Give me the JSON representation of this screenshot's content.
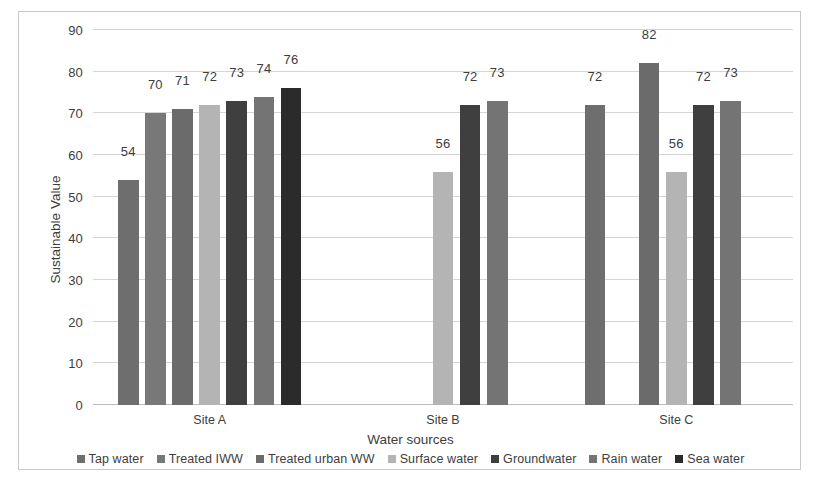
{
  "chart_data": {
    "type": "bar",
    "title": "",
    "xlabel": "Water sources",
    "ylabel": "Sustainable Value",
    "categories": [
      "Site A",
      "Site B",
      "Site C"
    ],
    "ylim": [
      0,
      90
    ],
    "yticks": [
      0,
      10,
      20,
      30,
      40,
      50,
      60,
      70,
      80,
      90
    ],
    "grid": true,
    "legend_position": "bottom",
    "series": [
      {
        "name": "Tap water",
        "color": "#6e6e6e",
        "values": [
          54,
          null,
          72
        ],
        "labels": [
          "54",
          "",
          "72"
        ]
      },
      {
        "name": "Treated IWW",
        "color": "#787878",
        "values": [
          70,
          null,
          null
        ],
        "labels": [
          "70",
          "",
          ""
        ]
      },
      {
        "name": "Treated urban WW",
        "color": "#6b6b6b",
        "values": [
          71,
          null,
          82
        ],
        "labels": [
          "71",
          "",
          "82"
        ]
      },
      {
        "name": "Surface water",
        "color": "#b4b4b4",
        "values": [
          72,
          56,
          56
        ],
        "labels": [
          "72",
          "56",
          "56"
        ]
      },
      {
        "name": "Groundwater",
        "color": "#3f3f3f",
        "values": [
          73,
          72,
          72
        ],
        "labels": [
          "73",
          "72",
          "72"
        ]
      },
      {
        "name": "Rain water",
        "color": "#747474",
        "values": [
          74,
          73,
          73
        ],
        "labels": [
          "74",
          "73",
          "73"
        ]
      },
      {
        "name": "Sea water",
        "color": "#2b2b2b",
        "values": [
          76,
          null,
          null
        ],
        "labels": [
          "76",
          "",
          ""
        ]
      }
    ]
  },
  "axis": {
    "y_title": "Sustainable Value",
    "x_title": "Water sources",
    "y_tick_labels": [
      "90",
      "80",
      "70",
      "60",
      "50",
      "40",
      "30",
      "20",
      "10",
      "0"
    ],
    "category_labels": [
      "Site A",
      "Site B",
      "Site C"
    ]
  },
  "legend": {
    "items": [
      {
        "label": "Tap water",
        "color": "#6e6e6e"
      },
      {
        "label": "Treated IWW",
        "color": "#787878"
      },
      {
        "label": "Treated urban WW",
        "color": "#6b6b6b"
      },
      {
        "label": "Surface water",
        "color": "#b4b4b4"
      },
      {
        "label": "Groundwater",
        "color": "#3f3f3f"
      },
      {
        "label": "Rain water",
        "color": "#747474"
      },
      {
        "label": "Sea water",
        "color": "#2b2b2b"
      }
    ]
  }
}
